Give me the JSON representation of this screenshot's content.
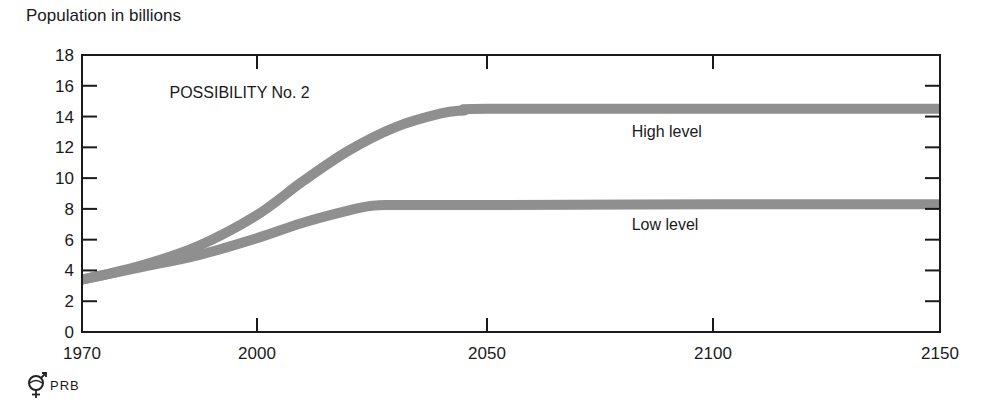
{
  "chart_data": {
    "type": "line",
    "title": "POSSIBILITY No. 2",
    "ylabel": "Population in billions",
    "xlabel": "",
    "ylim": [
      0,
      18
    ],
    "xlim": [
      1970,
      2150
    ],
    "grid": false,
    "yticks": [
      0,
      2,
      4,
      6,
      8,
      10,
      12,
      14,
      16,
      18
    ],
    "xticks": [
      1970,
      2000,
      2050,
      2100,
      2150
    ],
    "xtick_pixels": [
      82,
      257,
      487,
      713,
      940
    ],
    "series": [
      {
        "name": "High level",
        "x": [
          1970,
          1980,
          1990,
          2000,
          2010,
          2020,
          2030,
          2040,
          2045,
          2050,
          2100,
          2150
        ],
        "values": [
          3.4,
          4.3,
          5.6,
          7.6,
          9.8,
          11.8,
          13.3,
          14.2,
          14.4,
          14.5,
          14.5,
          14.5
        ]
      },
      {
        "name": "Low level",
        "x": [
          1970,
          1980,
          1990,
          2000,
          2010,
          2020,
          2025,
          2030,
          2050,
          2100,
          2150
        ],
        "values": [
          3.4,
          4.2,
          5.0,
          6.1,
          7.1,
          7.9,
          8.2,
          8.25,
          8.25,
          8.3,
          8.3
        ]
      }
    ],
    "annotations": [
      {
        "text": "POSSIBILITY No. 2",
        "x": 1985,
        "y": 15.2
      },
      {
        "text": "High level",
        "x": 2082,
        "y": 12.7
      },
      {
        "text": "Low level",
        "x": 2082,
        "y": 6.6
      }
    ]
  },
  "footer": {
    "logo_text": "PRB"
  },
  "style": {
    "line_color": "#8f8f8f",
    "axis_color": "#1a1a1a"
  }
}
